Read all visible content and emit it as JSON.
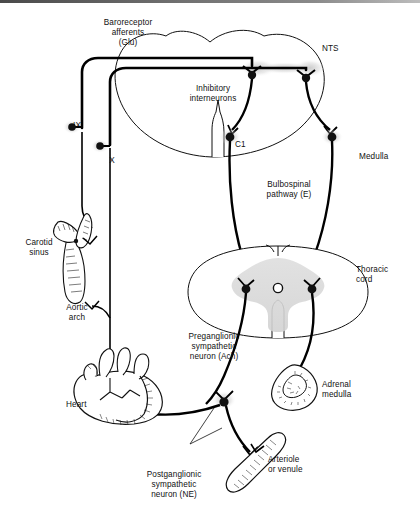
{
  "figure": {
    "type": "anatomical-diagram"
  },
  "labels": {
    "baroreceptor_afferents": "Baroreceptor\nafferents\n(Glu)",
    "nts": "NTS",
    "inhibitory_interneurons": "Inhibitory\ninterneurons",
    "c1": "C1",
    "medulla": "Medulla",
    "nerve_ix": "IX",
    "nerve_x": "X",
    "carotid_sinus": "Carotid\nsinus",
    "aortic_arch": "Aortic\narch",
    "bulbospinal_pathway": "Bulbospinal\npathway (E)",
    "thoracic_cord": "Thoracic\ncord",
    "preganglionic": "Preganglionic\nsympathetic\nneuron (Ach)",
    "postganglionic": "Postganglionic\nsympathetic\nneuron (NE)",
    "heart": "Heart",
    "adrenal_medulla": "Adrenal\nmedulla",
    "arteriole_or_venule": "Arteriole\nor venule"
  },
  "colors": {
    "ink": "#111111",
    "line": "#000000",
    "gray_matter": "#d9d9d9",
    "halo": "#cfcfcf",
    "page": "#ffffff"
  }
}
